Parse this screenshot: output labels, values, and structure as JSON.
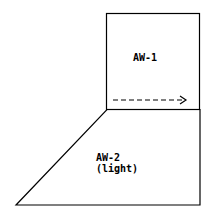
{
  "diagram": {
    "regions": [
      {
        "id": "aw1",
        "label": "AW-1"
      },
      {
        "id": "aw2",
        "label_line1": "AW-2",
        "label_line2": "(light)"
      }
    ],
    "arrow": {
      "style": "dashed",
      "direction": "right"
    },
    "colors": {
      "stroke": "#000000",
      "background": "#ffffff"
    }
  }
}
